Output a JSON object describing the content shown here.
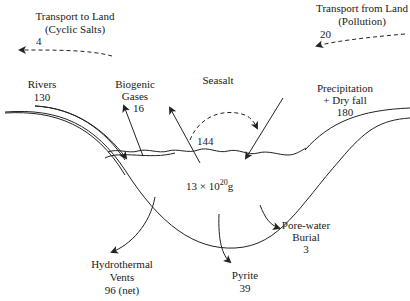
{
  "diagram": {
    "reservoir": {
      "mass_base": "13 × 10",
      "mass_exp": "20",
      "mass_unit": "g"
    },
    "fluxes": {
      "transport_to_land": {
        "line1": "Transport to Land",
        "line2": "(Cyclic Salts)",
        "value": "4"
      },
      "transport_from_land": {
        "line1": "Transport from Land",
        "line2": "(Pollution)",
        "value": "20"
      },
      "rivers": {
        "line1": "Rivers",
        "value": "130"
      },
      "biogenic_gases": {
        "line1": "Biogenic",
        "line2": "Gases",
        "value": "16"
      },
      "seasalt": {
        "line1": "Seasalt",
        "value": "144"
      },
      "precipitation": {
        "line1": "Precipitation",
        "line2": "+ Dry fall",
        "value": "180"
      },
      "hydrothermal": {
        "line1": "Hydrothermal",
        "line2": "Vents",
        "value": "96 (net)"
      },
      "pyrite": {
        "line1": "Pyrite",
        "value": "39"
      },
      "porewater": {
        "line1": "Pore-water",
        "line2": "Burial",
        "value": "3"
      }
    }
  }
}
